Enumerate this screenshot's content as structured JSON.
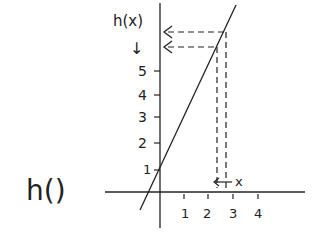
{
  "function_label": "h()",
  "y_axis_label": "h(x)",
  "y_axis_arrow": "↓",
  "x_input_label": "x",
  "x_ticks": [
    "1",
    "2",
    "3",
    "4"
  ],
  "y_ticks": [
    "1",
    "2",
    "3",
    "4",
    "5"
  ],
  "colors": {
    "ink": "#222222",
    "background": "#ffffff"
  }
}
